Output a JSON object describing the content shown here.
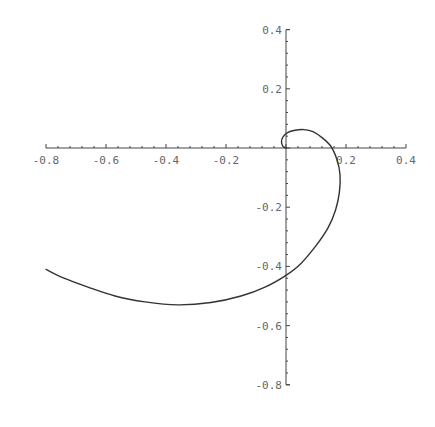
{
  "chart_data": {
    "type": "line",
    "title": "",
    "xlabel": "",
    "ylabel": "",
    "xlim": [
      -0.8,
      0.4
    ],
    "ylim": [
      -0.8,
      0.4
    ],
    "grid": false,
    "legend": null,
    "axes_origin": [
      0,
      0
    ],
    "x_ticks": [
      -0.8,
      -0.6,
      -0.4,
      -0.2,
      0.2,
      0.4
    ],
    "x_tick_labels": [
      "-0.8",
      "-0.6",
      "-0.4",
      "-0.2",
      "0.2",
      "0.4"
    ],
    "y_ticks": [
      0.4,
      0.2,
      -0.2,
      -0.4,
      -0.6,
      -0.8
    ],
    "y_tick_labels": [
      "0.4",
      "0.2",
      "-0.2",
      "-0.4",
      "-0.6",
      "-0.8"
    ],
    "minor_ticks_per_interval": 4,
    "series": [
      {
        "name": "spiral",
        "color": "#333333",
        "points": [
          [
            0.0,
            0.0
          ],
          [
            -0.01,
            0.005
          ],
          [
            -0.015,
            0.02
          ],
          [
            -0.01,
            0.038
          ],
          [
            0.005,
            0.052
          ],
          [
            0.03,
            0.06
          ],
          [
            0.06,
            0.062
          ],
          [
            0.09,
            0.055
          ],
          [
            0.12,
            0.035
          ],
          [
            0.15,
            0.005
          ],
          [
            0.17,
            -0.04
          ],
          [
            0.18,
            -0.09
          ],
          [
            0.178,
            -0.15
          ],
          [
            0.165,
            -0.21
          ],
          [
            0.14,
            -0.27
          ],
          [
            0.1,
            -0.33
          ],
          [
            0.05,
            -0.39
          ],
          [
            0.0,
            -0.43
          ],
          [
            -0.07,
            -0.47
          ],
          [
            -0.15,
            -0.5
          ],
          [
            -0.25,
            -0.522
          ],
          [
            -0.36,
            -0.53
          ],
          [
            -0.47,
            -0.52
          ],
          [
            -0.57,
            -0.5
          ],
          [
            -0.66,
            -0.47
          ],
          [
            -0.74,
            -0.44
          ],
          [
            -0.8,
            -0.41
          ]
        ]
      }
    ]
  }
}
